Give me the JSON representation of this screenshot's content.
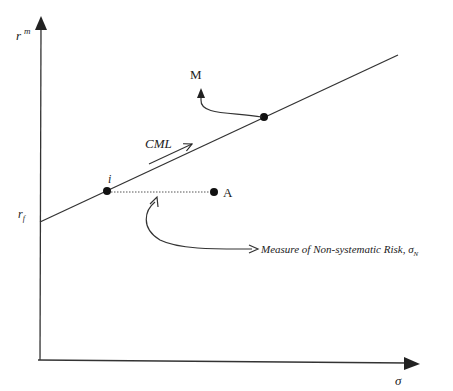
{
  "diagram": {
    "type": "capital-market-line",
    "axes": {
      "y_label": "r",
      "y_label_sup": "m",
      "x_label": "σ",
      "y_intercept_label": "r",
      "y_intercept_sub": "f"
    },
    "line": {
      "label": "CML"
    },
    "points": {
      "i": {
        "label": "i"
      },
      "A": {
        "label": "A"
      },
      "M": {
        "label": "M"
      }
    },
    "annotation": {
      "text": "Measure of Non-systematic Risk, ",
      "symbol": "σ",
      "symbol_sub": "N"
    }
  }
}
